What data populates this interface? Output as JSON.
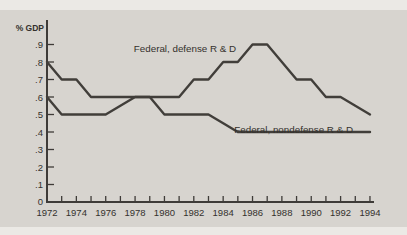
{
  "page": {
    "background_color": "#ebe9e5",
    "panel_color": "#d7d4cf"
  },
  "chart": {
    "axis_color": "#3e3b38",
    "line_color": "#413e3a",
    "text_color": "#34312d",
    "ylabel": "% GDP"
  },
  "chart_data": {
    "type": "line",
    "title": "",
    "xlabel": "",
    "ylabel": "% GDP",
    "grid": false,
    "legend_position": "inline-annotations",
    "x": [
      1972,
      1973,
      1974,
      1975,
      1976,
      1977,
      1978,
      1979,
      1980,
      1981,
      1982,
      1983,
      1984,
      1985,
      1986,
      1987,
      1988,
      1989,
      1990,
      1991,
      1992,
      1993,
      1994
    ],
    "series": [
      {
        "key": "federal-defense-rd",
        "name": "Federal, defense R & D",
        "values": [
          0.8,
          0.7,
          0.7,
          0.6,
          0.6,
          0.6,
          0.6,
          0.6,
          0.6,
          0.6,
          0.7,
          0.7,
          0.8,
          0.8,
          0.9,
          0.9,
          0.8,
          0.7,
          0.7,
          0.6,
          0.6,
          0.55,
          0.5
        ]
      },
      {
        "key": "federal-nondefense-rd",
        "name": "Federal, nondefense R & D",
        "values": [
          0.6,
          0.5,
          0.5,
          0.5,
          0.5,
          0.55,
          0.6,
          0.6,
          0.5,
          0.5,
          0.5,
          0.5,
          0.45,
          0.4,
          0.4,
          0.4,
          0.4,
          0.4,
          0.4,
          0.4,
          0.4,
          0.4,
          0.4
        ]
      }
    ],
    "ylim": [
      0,
      1.04
    ],
    "yticks": [
      0.1,
      0.2,
      0.3,
      0.4,
      0.5,
      0.6,
      0.7,
      0.8,
      0.9
    ],
    "ytick_labels": [
      ".1",
      ".2",
      ".3",
      ".4",
      ".5",
      ".6",
      ".7",
      ".8",
      ".9"
    ],
    "origin_label": "0",
    "xtick_labels": [
      "1972",
      "1974",
      "1976",
      "1978",
      "1980",
      "1982",
      "1984",
      "1986",
      "1988",
      "1990",
      "1992",
      "1994"
    ],
    "annotations": [
      {
        "key": "defense-line-label",
        "text": "Federal, defense R & D",
        "x": 1981.4,
        "y": 0.86
      },
      {
        "key": "nondefense-line-label",
        "text": "Federal, nondefense R & D",
        "x": 1988.8,
        "y": 0.395
      }
    ]
  }
}
